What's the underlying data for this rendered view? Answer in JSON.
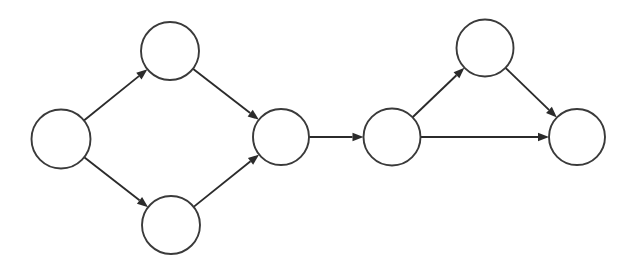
{
  "diagram": {
    "type": "directed-graph",
    "background_color": "#ffffff",
    "stroke_color": "#2b2b2b",
    "node_fill_color": "#ffffff",
    "node_stroke_color": "#3a3a3a",
    "canvas": {
      "width": 633,
      "height": 271
    },
    "nodes": [
      {
        "id": "n1",
        "label": "",
        "cx": 61,
        "cy": 139,
        "r": 29.5
      },
      {
        "id": "n2",
        "label": "",
        "cx": 170,
        "cy": 51,
        "r": 29.0
      },
      {
        "id": "n3",
        "label": "",
        "cx": 171,
        "cy": 225,
        "r": 29.0
      },
      {
        "id": "n4",
        "label": "",
        "cx": 281,
        "cy": 137,
        "r": 28.0
      },
      {
        "id": "n5",
        "label": "",
        "cx": 392,
        "cy": 137,
        "r": 28.5
      },
      {
        "id": "n6",
        "label": "",
        "cx": 485,
        "cy": 48,
        "r": 28.5
      },
      {
        "id": "n7",
        "label": "",
        "cx": 577,
        "cy": 137,
        "r": 28.0
      }
    ],
    "edges": [
      {
        "id": "e1",
        "from": "n1",
        "to": "n2",
        "label": "",
        "directed": true
      },
      {
        "id": "e2",
        "from": "n1",
        "to": "n3",
        "label": "",
        "directed": true
      },
      {
        "id": "e3",
        "from": "n2",
        "to": "n4",
        "label": "",
        "directed": true
      },
      {
        "id": "e4",
        "from": "n3",
        "to": "n4",
        "label": "",
        "directed": true
      },
      {
        "id": "e5",
        "from": "n4",
        "to": "n5",
        "label": "",
        "directed": true
      },
      {
        "id": "e6",
        "from": "n5",
        "to": "n6",
        "label": "",
        "directed": true
      },
      {
        "id": "e7",
        "from": "n5",
        "to": "n7",
        "label": "",
        "directed": true
      },
      {
        "id": "e8",
        "from": "n6",
        "to": "n7",
        "label": "",
        "directed": true
      }
    ],
    "arrow": {
      "length": 11,
      "half_width": 4.2
    }
  }
}
